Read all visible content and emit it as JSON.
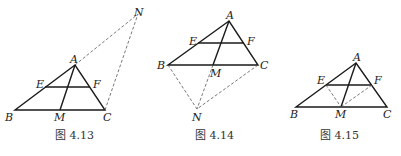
{
  "figures": [
    {
      "caption": "图 4.13",
      "points": {
        "A": {
          "label": "A",
          "x": 75,
          "y": 65
        },
        "B": {
          "label": "B",
          "x": 15,
          "y": 110
        },
        "C": {
          "label": "C",
          "x": 105,
          "y": 110
        },
        "M": {
          "label": "M",
          "x": 60,
          "y": 110
        },
        "E": {
          "label": "E",
          "x": 45,
          "y": 87
        },
        "F": {
          "label": "F",
          "x": 90,
          "y": 87
        },
        "N": {
          "label": "N",
          "x": 138,
          "y": 14
        }
      }
    },
    {
      "caption": "图 4.14",
      "points": {
        "A": {
          "label": "A",
          "x": 229,
          "y": 21
        },
        "B": {
          "label": "B",
          "x": 168,
          "y": 65
        },
        "C": {
          "label": "C",
          "x": 258,
          "y": 65
        },
        "M": {
          "label": "M",
          "x": 213,
          "y": 65
        },
        "E": {
          "label": "E",
          "x": 198,
          "y": 43
        },
        "F": {
          "label": "F",
          "x": 244,
          "y": 43
        },
        "N": {
          "label": "N",
          "x": 197,
          "y": 109
        }
      }
    },
    {
      "caption": "图 4.15",
      "points": {
        "A": {
          "label": "A",
          "x": 356,
          "y": 63
        },
        "B": {
          "label": "B",
          "x": 296,
          "y": 107
        },
        "C": {
          "label": "C",
          "x": 387,
          "y": 107
        },
        "M": {
          "label": "M",
          "x": 341,
          "y": 107
        },
        "E": {
          "label": "E",
          "x": 326,
          "y": 85
        },
        "F": {
          "label": "F",
          "x": 372,
          "y": 85
        }
      }
    }
  ]
}
